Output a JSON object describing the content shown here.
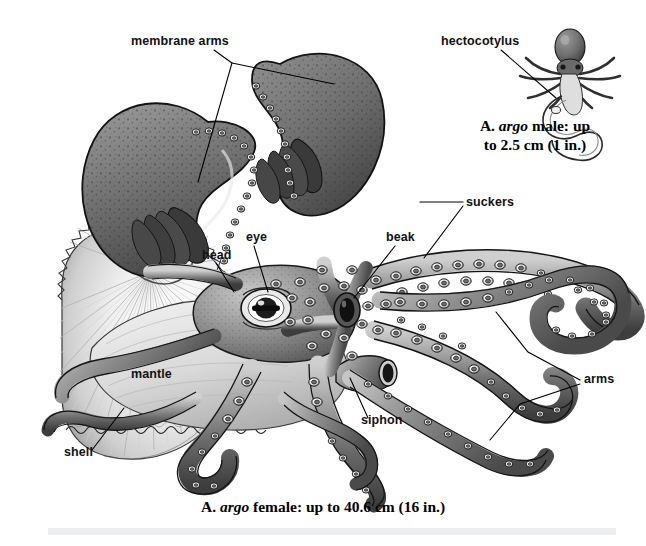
{
  "figure": {
    "background_color": "#ffffff",
    "ink_color": "#111111"
  },
  "labels": [
    {
      "id": "membrane-arms",
      "text": "membrane arms",
      "x": 131,
      "y": 45
    },
    {
      "id": "hectocotylus",
      "text": "hectocotylus",
      "x": 441,
      "y": 45
    },
    {
      "id": "suckers",
      "text": "suckers",
      "x": 466,
      "y": 206
    },
    {
      "id": "eye",
      "text": "eye",
      "x": 246,
      "y": 241
    },
    {
      "id": "beak",
      "text": "beak",
      "x": 386,
      "y": 241
    },
    {
      "id": "head",
      "text": "head",
      "x": 202,
      "y": 259
    },
    {
      "id": "mantle",
      "text": "mantle",
      "x": 131,
      "y": 378
    },
    {
      "id": "arms",
      "text": "arms",
      "x": 584,
      "y": 383
    },
    {
      "id": "siphon",
      "text": "siphon",
      "x": 361,
      "y": 424
    },
    {
      "id": "shell",
      "text": "shell",
      "x": 64,
      "y": 456
    }
  ],
  "captions": {
    "male": {
      "line1_prefix": "A. ",
      "line1_italic": "argo",
      "line1_suffix": " male: up",
      "line2": "to 2.5 cm (1 in.)",
      "x": 535,
      "y1": 131,
      "y2": 150
    },
    "female": {
      "prefix": "A. ",
      "italic": "argo",
      "suffix": " female: up to 40.6 cm (16 in.)",
      "x": 323,
      "y": 512
    }
  },
  "colors": {
    "skin_light": "#d8d8d8",
    "skin_mid": "#9a9a9a",
    "skin_dark": "#545454",
    "skin_darkest": "#2e2e2e",
    "web_dark": "#6f6f6f",
    "shell_light": "#f4f4f4",
    "shell_mid": "#cfcfcf",
    "sucker_ring": "#efefef",
    "outline": "#111111",
    "bottom_bar": "#eceef0"
  }
}
